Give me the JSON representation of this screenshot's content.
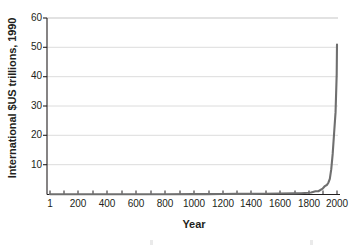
{
  "chart_data": {
    "type": "line",
    "title": "",
    "xlabel": "Year",
    "ylabel": "International $US trillions, 1990",
    "xlim": [
      1,
      2000
    ],
    "ylim": [
      0,
      60
    ],
    "grid": true,
    "legend": "none",
    "line_color": "#6f6f6f",
    "axis_color": "#231f20",
    "grid_color": "#d8d8d8",
    "xticks": [
      1,
      200,
      400,
      600,
      800,
      1000,
      1200,
      1400,
      1600,
      1800,
      2000
    ],
    "xtick_labels": [
      "1",
      "200",
      "400",
      "600",
      "800",
      "1000",
      "1200",
      "1400",
      "1600",
      "1800",
      "2000"
    ],
    "yticks": [
      10,
      20,
      30,
      40,
      50,
      60
    ],
    "ytick_labels": [
      "10",
      "20",
      "30",
      "40",
      "50",
      "60"
    ],
    "series": [
      {
        "name": "World GDP",
        "x": [
          1,
          200,
          400,
          600,
          800,
          1000,
          1100,
          1200,
          1300,
          1400,
          1500,
          1600,
          1700,
          1750,
          1800,
          1820,
          1850,
          1870,
          1900,
          1913,
          1930,
          1940,
          1950,
          1960,
          1970,
          1980,
          1990,
          1998,
          2000
        ],
        "values": [
          0.1,
          0.1,
          0.1,
          0.1,
          0.1,
          0.12,
          0.14,
          0.17,
          0.2,
          0.2,
          0.25,
          0.33,
          0.37,
          0.44,
          0.58,
          0.69,
          1.1,
          1.1,
          1.97,
          2.73,
          3.3,
          4.0,
          5.34,
          8.6,
          13.8,
          21.0,
          28.0,
          41.0,
          51.0
        ]
      }
    ]
  },
  "axis_labels": {
    "y_title": "International $US trillions, 1990",
    "x_title": "Year"
  }
}
